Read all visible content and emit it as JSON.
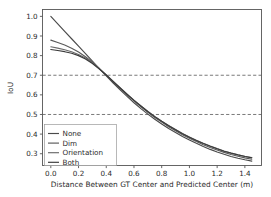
{
  "chart_data": {
    "type": "line",
    "title": "",
    "xlabel": "Distance Between GT Center and Predicted Center (m)",
    "ylabel": "IoU",
    "xlim": [
      -0.06,
      1.52
    ],
    "ylim": [
      0.24,
      1.035
    ],
    "grid": false,
    "legend_position": "lower left",
    "xticks": [
      "0.0",
      "0.2",
      "0.4",
      "0.6",
      "0.8",
      "1.0",
      "1.2",
      "1.4"
    ],
    "xtick_values": [
      0.0,
      0.2,
      0.4,
      0.6,
      0.8,
      1.0,
      1.2,
      1.4
    ],
    "yticks": [
      "0.3",
      "0.4",
      "0.5",
      "0.6",
      "0.7",
      "0.8",
      "0.9",
      "1.0"
    ],
    "ytick_values": [
      0.3,
      0.4,
      0.5,
      0.6,
      0.7,
      0.8,
      0.9,
      1.0
    ],
    "reference_lines": [
      {
        "axis": "y",
        "value": 0.7,
        "style": "dashed",
        "color": "#6b6b6b"
      },
      {
        "axis": "y",
        "value": 0.5,
        "style": "dashed",
        "color": "#6b6b6b"
      }
    ],
    "x": [
      0.0,
      0.05,
      0.1,
      0.15,
      0.2,
      0.25,
      0.3,
      0.35,
      0.4,
      0.45,
      0.5,
      0.55,
      0.6,
      0.65,
      0.7,
      0.75,
      0.8,
      0.85,
      0.9,
      0.95,
      1.0,
      1.05,
      1.1,
      1.15,
      1.2,
      1.25,
      1.3,
      1.35,
      1.4,
      1.45
    ],
    "series": [
      {
        "name": "None",
        "color": "#4a4a4a",
        "values": [
          1.0,
          0.962,
          0.924,
          0.886,
          0.848,
          0.81,
          0.772,
          0.734,
          0.697,
          0.66,
          0.625,
          0.592,
          0.56,
          0.53,
          0.502,
          0.476,
          0.452,
          0.429,
          0.408,
          0.388,
          0.37,
          0.353,
          0.337,
          0.322,
          0.309,
          0.297,
          0.286,
          0.277,
          0.269,
          0.262
        ]
      },
      {
        "name": "Dim",
        "color": "#5a5a5a",
        "values": [
          0.879,
          0.867,
          0.854,
          0.838,
          0.818,
          0.794,
          0.766,
          0.734,
          0.7,
          0.666,
          0.632,
          0.6,
          0.569,
          0.539,
          0.511,
          0.485,
          0.461,
          0.438,
          0.417,
          0.397,
          0.379,
          0.362,
          0.346,
          0.332,
          0.319,
          0.307,
          0.296,
          0.287,
          0.279,
          0.272
        ]
      },
      {
        "name": "Orientation",
        "color": "#6a6a6a",
        "values": [
          0.845,
          0.838,
          0.83,
          0.82,
          0.806,
          0.788,
          0.764,
          0.734,
          0.702,
          0.669,
          0.636,
          0.604,
          0.573,
          0.544,
          0.516,
          0.49,
          0.466,
          0.444,
          0.423,
          0.403,
          0.385,
          0.368,
          0.353,
          0.339,
          0.326,
          0.314,
          0.304,
          0.295,
          0.287,
          0.281
        ]
      },
      {
        "name": "Both",
        "color": "#3a3a3a",
        "values": [
          0.831,
          0.826,
          0.82,
          0.812,
          0.8,
          0.783,
          0.76,
          0.732,
          0.701,
          0.668,
          0.635,
          0.603,
          0.572,
          0.543,
          0.515,
          0.489,
          0.465,
          0.443,
          0.422,
          0.402,
          0.384,
          0.367,
          0.352,
          0.338,
          0.325,
          0.313,
          0.303,
          0.294,
          0.286,
          0.279
        ]
      }
    ]
  },
  "legend": {
    "entries": [
      "None",
      "Dim",
      "Orientation",
      "Both"
    ]
  },
  "axes": {
    "x_title": "Distance Between GT Center and Predicted Center (m)",
    "y_title": "IoU"
  }
}
